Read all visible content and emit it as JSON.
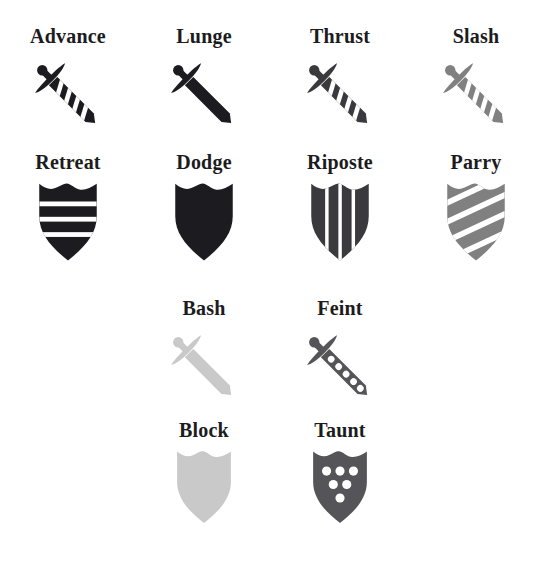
{
  "page": {
    "background_color": "#ffffff",
    "label_color": "#1c1c20",
    "columns": 4,
    "rows": 4
  },
  "palette": {
    "near_black": "#1c1c20",
    "dark_gray": "#3a3a3e",
    "mid_gray": "#6e6e72",
    "gray": "#808080",
    "light_gray": "#c9c9c9",
    "white": "#ffffff"
  },
  "rows": [
    {
      "index": 1,
      "offset_columns": 0,
      "items": [
        {
          "label": "Advance",
          "icon_name": "sword-striped-black-icon",
          "shape": "sword",
          "fill": "#1c1c20",
          "pattern": "diagonal-stripes",
          "pattern_count": 4
        },
        {
          "label": "Lunge",
          "icon_name": "sword-solid-black-icon",
          "shape": "sword",
          "fill": "#1c1c20",
          "pattern": "solid",
          "pattern_count": 0
        },
        {
          "label": "Thrust",
          "icon_name": "sword-striped-dark-gray-icon",
          "shape": "sword",
          "fill": "#3a3a3e",
          "pattern": "diagonal-stripes",
          "pattern_count": 4
        },
        {
          "label": "Slash",
          "icon_name": "sword-striped-gray-icon",
          "shape": "sword",
          "fill": "#808080",
          "pattern": "diagonal-stripes",
          "pattern_count": 4
        }
      ]
    },
    {
      "index": 2,
      "offset_columns": 0,
      "items": [
        {
          "label": "Retreat",
          "icon_name": "shield-horizontal-bars-black-icon",
          "shape": "shield",
          "fill": "#1c1c20",
          "pattern": "horizontal-bars",
          "pattern_count": 3
        },
        {
          "label": "Dodge",
          "icon_name": "shield-solid-black-icon",
          "shape": "shield",
          "fill": "#1c1c20",
          "pattern": "solid",
          "pattern_count": 0
        },
        {
          "label": "Riposte",
          "icon_name": "shield-vertical-bars-dark-gray-icon",
          "shape": "shield",
          "fill": "#3a3a3e",
          "pattern": "vertical-bars",
          "pattern_count": 3
        },
        {
          "label": "Parry",
          "icon_name": "shield-diagonal-bars-gray-icon",
          "shape": "shield",
          "fill": "#808080",
          "pattern": "diagonal-bars",
          "pattern_count": 3
        }
      ]
    },
    {
      "index": 3,
      "offset_columns": 1,
      "items": [
        {
          "label": "Bash",
          "icon_name": "sword-solid-light-gray-icon",
          "shape": "sword",
          "fill": "#c9c9c9",
          "pattern": "solid",
          "pattern_count": 0
        },
        {
          "label": "Feint",
          "icon_name": "sword-dotted-mid-gray-icon",
          "shape": "sword",
          "fill": "#555559",
          "pattern": "dots",
          "pattern_count": 5
        }
      ]
    },
    {
      "index": 4,
      "offset_columns": 1,
      "items": [
        {
          "label": "Block",
          "icon_name": "shield-solid-light-gray-icon",
          "shape": "shield",
          "fill": "#c9c9c9",
          "pattern": "solid",
          "pattern_count": 0
        },
        {
          "label": "Taunt",
          "icon_name": "shield-dotted-mid-gray-icon",
          "shape": "shield",
          "fill": "#555559",
          "pattern": "dots",
          "pattern_count": 6
        }
      ]
    }
  ]
}
